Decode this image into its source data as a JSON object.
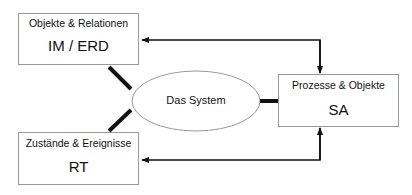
{
  "diagram": {
    "boxes": [
      {
        "id": "im_erd",
        "title": "Objekte & Relationen",
        "label": "IM / ERD"
      },
      {
        "id": "sa",
        "title": "Prozesse & Objekte",
        "label": "SA"
      },
      {
        "id": "rt",
        "title": "Zustände & Ereignisse",
        "label": "RT"
      }
    ],
    "center": {
      "label": "Das System"
    },
    "colors": {
      "line": "#111111",
      "box_border": "#999999",
      "ellipse_border": "#999999"
    }
  }
}
